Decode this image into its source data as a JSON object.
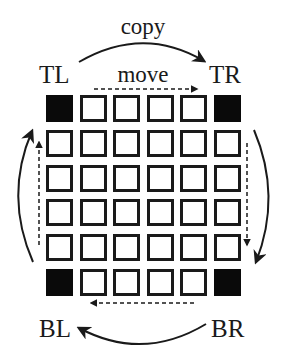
{
  "diagram": {
    "labels": {
      "top_left": "TL",
      "top_right": "TR",
      "bottom_left": "BL",
      "bottom_right": "BR",
      "copy": "copy",
      "move": "move"
    },
    "grid": {
      "rows": 6,
      "cols": 6,
      "corner_cells": [
        "TL",
        "TR",
        "BL",
        "BR"
      ],
      "corner_color": "#0a0a0a",
      "cell_border_color": "#1a1a1a"
    },
    "arrows": [
      {
        "type": "solid-arc",
        "from": "TL",
        "to": "TR",
        "label": "copy"
      },
      {
        "type": "solid-arc",
        "from": "TR",
        "to": "BR"
      },
      {
        "type": "solid-arc",
        "from": "BR",
        "to": "BL"
      },
      {
        "type": "solid-arc",
        "from": "BL",
        "to": "TL"
      },
      {
        "type": "dashed",
        "direction": "right",
        "along": "top row",
        "label": "move"
      },
      {
        "type": "dashed",
        "direction": "down",
        "along": "right column"
      },
      {
        "type": "dashed",
        "direction": "left",
        "along": "bottom row"
      },
      {
        "type": "dashed",
        "direction": "up",
        "along": "left column"
      }
    ]
  }
}
